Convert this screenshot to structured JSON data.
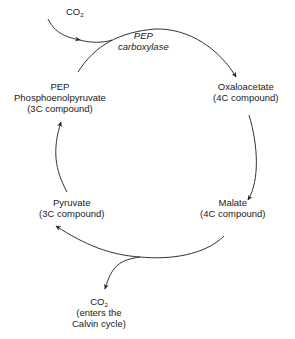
{
  "diagram": {
    "input": {
      "molecule": "CO",
      "subscript": "2"
    },
    "enzyme": {
      "line1": "PEP",
      "line2": "carboxylase"
    },
    "nodes": [
      {
        "id": "pep",
        "lines": [
          "PEP",
          "Phosphoenolpyruvate",
          "(3C compound)"
        ]
      },
      {
        "id": "oxaloacetate",
        "lines": [
          "Oxaloacetate",
          "(4C compound)"
        ]
      },
      {
        "id": "malate",
        "lines": [
          "Malate",
          "(4C compound)"
        ]
      },
      {
        "id": "pyruvate",
        "lines": [
          "Pyruvate",
          "(3C compound)"
        ]
      }
    ],
    "output": {
      "molecule": "CO",
      "subscript": "2",
      "line2": "(enters the",
      "line3": "Calvin cycle)"
    },
    "colors": {
      "line": "#333333",
      "text": "#1a1a1a",
      "background": "#ffffff"
    }
  }
}
